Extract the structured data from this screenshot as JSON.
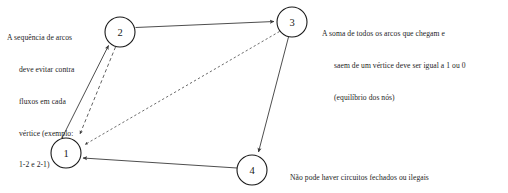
{
  "diagram": {
    "background_color": "#ffffff",
    "line_color": "#3a3a3a",
    "node_stroke_color": "#1a1a1a",
    "text_color": "#1d1d1d"
  },
  "nodes": [
    {
      "id": "1",
      "label": "1",
      "cx": 66,
      "cy": 153,
      "r": 15
    },
    {
      "id": "2",
      "label": "2",
      "cx": 120,
      "cy": 32,
      "r": 15
    },
    {
      "id": "3",
      "label": "3",
      "cx": 292,
      "cy": 22,
      "r": 15
    },
    {
      "id": "4",
      "label": "4",
      "cx": 252,
      "cy": 170,
      "r": 15
    }
  ],
  "edges": [
    {
      "id": "edge-2-3",
      "from": "2",
      "to": "3",
      "style": "solid",
      "arrow": "to"
    },
    {
      "id": "edge-1-2",
      "from": "1",
      "to": "2",
      "style": "solid",
      "arrow": "to"
    },
    {
      "id": "edge-2-1",
      "from": "2",
      "to": "1",
      "style": "dashed",
      "arrow": "to"
    },
    {
      "id": "edge-3-1",
      "from": "3",
      "to": "1",
      "style": "dotted",
      "arrow": "to"
    },
    {
      "id": "edge-3-4",
      "from": "3",
      "to": "4",
      "style": "solid",
      "arrow": "to"
    },
    {
      "id": "edge-4-1",
      "from": "4",
      "to": "1",
      "style": "solid",
      "arrow": "to"
    }
  ],
  "annotations": {
    "contraflow": {
      "name": "contraflow-note",
      "lines": [
        "A sequência de arcos",
        "deve evitar contra",
        "fluxos em cada",
        "vértice (exemplo:",
        "1-2 e 2-1)"
      ]
    },
    "balance": {
      "name": "node-balance-note",
      "lines": [
        "A soma de todos os arcos que chegam e",
        "saem de um vértice deve ser igual a 1 ou 0",
        "(equilíbrio dos nós)"
      ]
    },
    "circuits": {
      "name": "closed-circuits-note",
      "lines": [
        "Não pode haver circuitos fechados ou ilegais",
        "(exemplo: 1-2-3-1)"
      ]
    }
  }
}
